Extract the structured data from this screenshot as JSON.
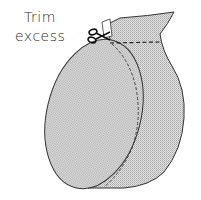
{
  "annotation": {
    "line1": "Trim",
    "line2": "excess"
  },
  "illustration": {
    "subject": "round cushion cover being sewn, with excess fabric trimmed",
    "fill_pattern": "crosshatch",
    "colors": {
      "outline": "#333333",
      "fill": "#d4d4d4",
      "background": "#ffffff"
    }
  },
  "icons": {
    "scissors": "scissors-icon"
  }
}
